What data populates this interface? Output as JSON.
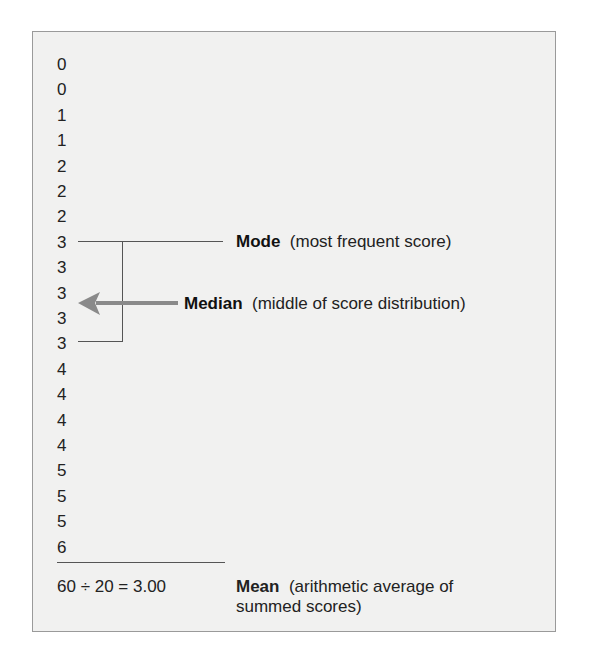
{
  "diagram": {
    "scores": [
      "0",
      "0",
      "1",
      "1",
      "2",
      "2",
      "2",
      "3",
      "3",
      "3",
      "3",
      "3",
      "4",
      "4",
      "4",
      "4",
      "5",
      "5",
      "5",
      "6"
    ],
    "mode": {
      "term": "Mode",
      "description": "(most frequent score)"
    },
    "median": {
      "term": "Median",
      "description": "(middle of score distribution)"
    },
    "mean": {
      "formula": "60 ÷ 20 = 3.00",
      "term": "Mean",
      "description": "(arithmetic average of summed scores)"
    },
    "colors": {
      "panel_background": "#f1f1f0",
      "border": "#9a9a9a",
      "arrow": "#8a8a8a",
      "lines": "#555555"
    }
  }
}
